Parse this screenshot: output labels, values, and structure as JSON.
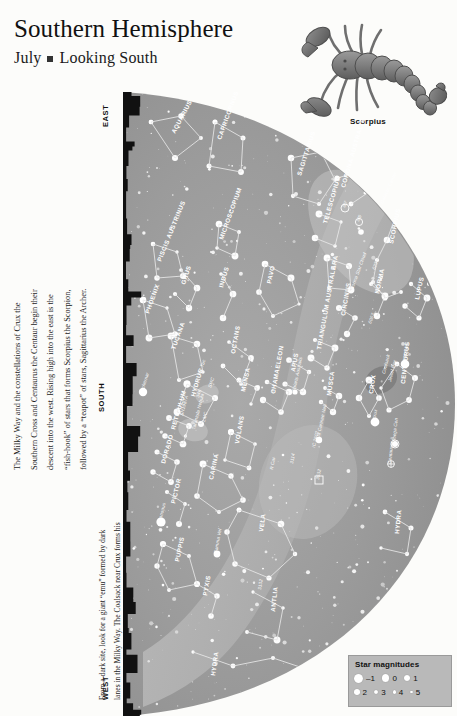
{
  "header": {
    "title": "Southern Hemisphere",
    "month": "July",
    "separator": "■",
    "view": "Looking South"
  },
  "illustration": {
    "caption": "Scorpius",
    "name": "scorpion-illustration"
  },
  "body_text": {
    "left_column": "The Milky Way and the constellations of Crux the Southern Cross and Centaurus the Centaur begin their descent into the west. Rising high into the east is the “fish-hook” of stars that forms Scorpius the Scorpion, followed by a “teapot” of stars, Sagittarius the Archer.",
    "right_column_1": "From a dark site, look for a giant “emu” formed by dark lanes in the Milky Way. The Coalsack near Crux forms his head, a dark band from Alpha Centauri to Scorpius forms his neck, while his legs are found in dark lanes streaming down from Scorpius.",
    "left_lines": [
      "The Milky Way and the constellations of Crux the",
      "Southern Cross and Centaurus the Centaur begin their",
      "descent into the west. Rising high into the east is the",
      "“fish-hook” of stars that forms Scorpius the Scorpion,",
      "followed by a “teapot” of stars, Sagittarius the Archer."
    ],
    "right_lines_1": [
      "From a dark site, look for a giant “emu” formed by dark",
      "lanes in the Milky Way. The Coalsack near Crux forms his",
      "head, a dark band from Alpha Centauri to Scorpius forms",
      "his neck, while his legs are found in dark lanes streaming",
      "down from Scorpius."
    ]
  },
  "compass": {
    "east": "EAST",
    "south": "SOUTH",
    "west": "WEST"
  },
  "legend": {
    "title": "Star magnitudes",
    "row1": [
      {
        "label": "–1",
        "size": 9
      },
      {
        "label": "0",
        "size": 7.5
      },
      {
        "label": "1",
        "size": 6.5
      }
    ],
    "row2": [
      {
        "label": "2",
        "size": 5.5
      },
      {
        "label": "3",
        "size": 4.2
      },
      {
        "label": "4",
        "size": 3.2
      },
      {
        "label": "5",
        "size": 2.4
      }
    ],
    "background": "#b9b9b9"
  },
  "chart_data": {
    "type": "scatter",
    "projection": "all-sky horizon dome",
    "sky_fill": "#9d9d9d",
    "milkyway_fill": "#b4b4b4",
    "horizon_fill": "#111111",
    "constellations": [
      {
        "name": "AQUARIUS",
        "x": 52,
        "y": 42,
        "rot": -62
      },
      {
        "name": "CAPRICORNUS",
        "x": 98,
        "y": 48,
        "rot": -70
      },
      {
        "name": "SAGITTARIUS",
        "x": 178,
        "y": 84,
        "rot": -72
      },
      {
        "name": "MICROSCOPIUM",
        "x": 100,
        "y": 148,
        "rot": -70
      },
      {
        "name": "PISCIS AUSTRINUS",
        "x": 38,
        "y": 170,
        "rot": -68
      },
      {
        "name": "GRUS",
        "x": 62,
        "y": 193,
        "rot": -72
      },
      {
        "name": "INDUS",
        "x": 100,
        "y": 196,
        "rot": -74
      },
      {
        "name": "PAVO",
        "x": 148,
        "y": 192,
        "rot": -78
      },
      {
        "name": "PHOENIX",
        "x": 26,
        "y": 222,
        "rot": -70
      },
      {
        "name": "TUCANA",
        "x": 52,
        "y": 258,
        "rot": -70
      },
      {
        "name": "OCTANS",
        "x": 112,
        "y": 262,
        "rot": -80
      },
      {
        "name": "HYDRUS",
        "x": 72,
        "y": 305,
        "rot": -74
      },
      {
        "name": "APUS",
        "x": 172,
        "y": 280,
        "rot": -80
      },
      {
        "name": "CORONA AUSTRALIS",
        "x": 222,
        "y": 96,
        "rot": -74
      },
      {
        "name": "TELESCOPIUM",
        "x": 204,
        "y": 132,
        "rot": -74
      },
      {
        "name": "ARA",
        "x": 212,
        "y": 178,
        "rot": -78
      },
      {
        "name": "SCORPIUS",
        "x": 270,
        "y": 152,
        "rot": -78
      },
      {
        "name": "NORMA",
        "x": 256,
        "y": 202,
        "rot": -78
      },
      {
        "name": "CIRCINUS",
        "x": 222,
        "y": 224,
        "rot": -80
      },
      {
        "name": "LUPUS",
        "x": 296,
        "y": 208,
        "rot": -78
      },
      {
        "name": "TRIANGULUM AUSTRALE",
        "x": 198,
        "y": 258,
        "rot": -80
      },
      {
        "name": "CENTAURUS",
        "x": 282,
        "y": 292,
        "rot": -84
      },
      {
        "name": "CRUX",
        "x": 250,
        "y": 302,
        "rot": -82
      },
      {
        "name": "MUSCA",
        "x": 208,
        "y": 304,
        "rot": -82
      },
      {
        "name": "CHAMAELEON",
        "x": 152,
        "y": 302,
        "rot": -80
      },
      {
        "name": "MENSA",
        "x": 122,
        "y": 300,
        "rot": -78
      },
      {
        "name": "VOLANS",
        "x": 116,
        "y": 352,
        "rot": -80
      },
      {
        "name": "CARINA",
        "x": 90,
        "y": 388,
        "rot": -78
      },
      {
        "name": "RETICULUM",
        "x": 52,
        "y": 338,
        "rot": -74
      },
      {
        "name": "DORADO",
        "x": 42,
        "y": 372,
        "rot": -74
      },
      {
        "name": "PICTOR",
        "x": 52,
        "y": 412,
        "rot": -76
      },
      {
        "name": "VELA",
        "x": 140,
        "y": 440,
        "rot": -82
      },
      {
        "name": "PUPPIS",
        "x": 56,
        "y": 470,
        "rot": -78
      },
      {
        "name": "PYXIS",
        "x": 84,
        "y": 504,
        "rot": -80
      },
      {
        "name": "ANTLIA",
        "x": 152,
        "y": 520,
        "rot": -84
      },
      {
        "name": "HYDRA",
        "x": 276,
        "y": 442,
        "rot": -84
      },
      {
        "name": "HYDRA_2",
        "x": 92,
        "y": 584,
        "rot": -82
      }
    ],
    "deep_sky_objects": [
      {
        "label": "Galactic Center",
        "x": 260,
        "y": 112,
        "rot": -66
      },
      {
        "label": "M7",
        "x": 222,
        "y": 116,
        "rot": -66
      },
      {
        "label": "M6",
        "x": 236,
        "y": 130,
        "rot": -66
      },
      {
        "label": "6231",
        "x": 252,
        "y": 178,
        "rot": -70
      },
      {
        "label": "Norma Star Cloud",
        "x": 230,
        "y": 198,
        "rot": -70
      },
      {
        "label": "6067",
        "x": 248,
        "y": 232,
        "rot": -70
      },
      {
        "label": "47 Tuc",
        "x": 78,
        "y": 282,
        "rot": -72
      },
      {
        "label": "SMC",
        "x": 88,
        "y": 296,
        "rot": -72
      },
      {
        "label": "346",
        "x": 76,
        "y": 306,
        "rot": -72
      },
      {
        "label": "Achernar",
        "x": 20,
        "y": 300,
        "rot": -72
      },
      {
        "label": "Polaris Australis",
        "x": 172,
        "y": 300,
        "rot": -78
      },
      {
        "label": "SN1987A",
        "x": 60,
        "y": 324,
        "rot": -76
      },
      {
        "label": "LMC",
        "x": 82,
        "y": 330,
        "rot": -76
      },
      {
        "label": "Tarantula Nebula",
        "x": 72,
        "y": 338,
        "rot": -76
      },
      {
        "label": "Coalsack",
        "x": 262,
        "y": 282,
        "rot": -76
      },
      {
        "label": "Jewel Box",
        "x": 268,
        "y": 290,
        "rot": -76
      },
      {
        "label": "Beta Cen",
        "x": 282,
        "y": 272,
        "rot": -80
      },
      {
        "label": "Acrux",
        "x": 252,
        "y": 330,
        "rot": -80
      },
      {
        "label": "Omega Cen",
        "x": 272,
        "y": 352,
        "rot": -84
      },
      {
        "label": "Centaurus A",
        "x": 268,
        "y": 372,
        "rot": -84
      },
      {
        "label": "Eta Carinae Neb",
        "x": 196,
        "y": 348,
        "rot": -78
      },
      {
        "label": "IC 2602",
        "x": 192,
        "y": 356,
        "rot": -78
      },
      {
        "label": "3114",
        "x": 170,
        "y": 372,
        "rot": -80
      },
      {
        "label": "3532",
        "x": 196,
        "y": 388,
        "rot": -80
      },
      {
        "label": "R Car",
        "x": 150,
        "y": 378,
        "rot": -80
      },
      {
        "label": "Canopus",
        "x": 38,
        "y": 430,
        "rot": -76
      },
      {
        "label": "Gamma Vel",
        "x": 94,
        "y": 462,
        "rot": -80
      },
      {
        "label": "3132",
        "x": 138,
        "y": 498,
        "rot": -82
      }
    ]
  }
}
